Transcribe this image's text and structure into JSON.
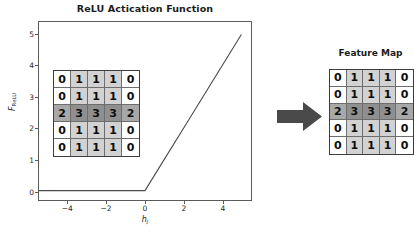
{
  "figure": {
    "background": "#ffffff",
    "width": 418,
    "height": 236
  },
  "plot": {
    "title": "ReLU Actication Function",
    "xlabel": "h",
    "xlabel_sub": "j",
    "ylabel": "F",
    "ylabel_sub": "ReLU",
    "line_color": "#4a4a4a",
    "frame_color": "#5b5b5b"
  },
  "chart_data": {
    "type": "line",
    "title": "ReLU Actication Function",
    "xlabel": "h_j",
    "ylabel": "F_ReLU",
    "xlim": [
      -5.5,
      5.5
    ],
    "ylim": [
      -0.3,
      5.4
    ],
    "xticks": [
      -4,
      -2,
      0,
      2,
      4
    ],
    "xtick_labels": [
      "−4",
      "−2",
      "0",
      "2",
      "4"
    ],
    "yticks": [
      0,
      1,
      2,
      3,
      4,
      5
    ],
    "ytick_labels": [
      "0",
      "1",
      "2",
      "3",
      "4",
      "5"
    ],
    "grid": false,
    "legend": null,
    "series": [
      {
        "name": "ReLU",
        "x": [
          -5.5,
          -5,
          -4,
          -3,
          -2,
          -1,
          0,
          1,
          2,
          3,
          4,
          5
        ],
        "y": [
          0,
          0,
          0,
          0,
          0,
          0,
          0,
          1,
          2,
          3,
          4,
          5
        ]
      }
    ]
  },
  "input_grid": {
    "name": "input-feature-matrix",
    "rows": 5,
    "cols": 5,
    "values": [
      [
        0,
        1,
        1,
        1,
        0
      ],
      [
        0,
        1,
        1,
        1,
        0
      ],
      [
        2,
        3,
        3,
        3,
        2
      ],
      [
        0,
        1,
        1,
        1,
        0
      ],
      [
        0,
        1,
        1,
        1,
        0
      ]
    ]
  },
  "feature_map": {
    "title": "Feature Map",
    "rows": 5,
    "cols": 5,
    "values": [
      [
        0,
        1,
        1,
        1,
        0
      ],
      [
        0,
        1,
        1,
        1,
        0
      ],
      [
        2,
        3,
        3,
        3,
        2
      ],
      [
        0,
        1,
        1,
        1,
        0
      ],
      [
        0,
        1,
        1,
        1,
        0
      ]
    ]
  },
  "value_colors": {
    "0": "#ffffff",
    "1": "#d2d2d2",
    "2": "#a8a8a8",
    "3": "#8f8f8f"
  },
  "arrow": {
    "name": "flow-arrow",
    "direction": "right",
    "color": "#4a4a4a"
  }
}
